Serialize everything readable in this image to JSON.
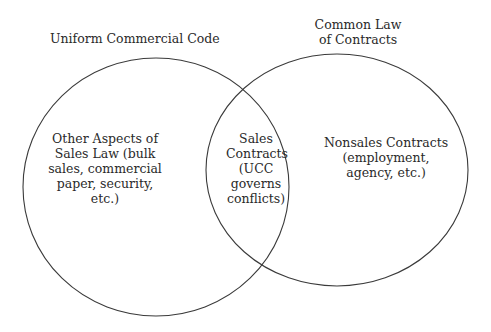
{
  "diagram": {
    "type": "venn",
    "sets": [
      {
        "id": "ucc",
        "title": "Uniform Commercial Code",
        "region_text": [
          "Other Aspects of",
          "Sales Law (bulk",
          "sales, commercial",
          "paper, security,",
          "etc.)"
        ]
      },
      {
        "id": "common_law",
        "title_lines": [
          "Common Law",
          "of Contracts"
        ],
        "region_text": [
          "Nonsales Contracts",
          "(employment,",
          "agency, etc.)"
        ]
      }
    ],
    "intersection": {
      "text": [
        "Sales",
        "Contracts",
        "(UCC",
        "governs",
        "conflicts)"
      ]
    },
    "colors": {
      "stroke": "#3a3a3a",
      "text": "#2a2a2a",
      "background": "#ffffff"
    }
  }
}
